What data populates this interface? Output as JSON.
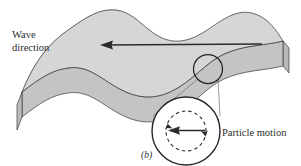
{
  "figure": {
    "caption": "(b)",
    "labels": {
      "wave_direction_line1": "Wave",
      "wave_direction_line2": "direction",
      "particle_motion": "Particle motion"
    },
    "colors": {
      "surface_fill": "#d6d6d6",
      "side_face_fill": "#c6c6c6",
      "front_face_fill": "#cfcfcf",
      "outline": "#3a3a3a",
      "arrow": "#2b2b2b",
      "text": "#2b2b2b",
      "background": "#ffffff",
      "inset_fill": "#ffffff"
    },
    "elements": {
      "wave_direction_arrow": "arrow pointing left",
      "detail_circle": "circle marking particle location on wave crest",
      "inset_circle": "magnified view of particle motion",
      "orbit_circle": "dashed circular orbit path",
      "orbit_arrowhead_left": "counterclockwise motion indicator",
      "orbit_arrowhead_right": "counterclockwise motion indicator",
      "particle_velocity_arrow": "arrow pointing left",
      "leader_line_left": "connector from detail circle to inset",
      "leader_line_right": "connector from detail circle to inset"
    }
  }
}
